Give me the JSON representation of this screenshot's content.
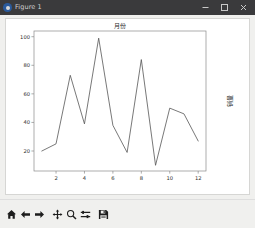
{
  "window": {
    "title": "Figure 1",
    "app_icon": "matplotlib-icon",
    "controls": [
      {
        "name": "minimize-button",
        "glyph": "minimize-icon"
      },
      {
        "name": "maximize-button",
        "glyph": "maximize-icon"
      },
      {
        "name": "close-button",
        "glyph": "close-icon"
      }
    ],
    "titlebar_color": "#3a3a3c",
    "chrome_color": "#f0f0ee"
  },
  "toolbar": {
    "buttons": [
      {
        "name": "home-button",
        "icon": "home-icon",
        "tooltip": "Reset original view"
      },
      {
        "name": "back-button",
        "icon": "arrow-left-icon",
        "tooltip": "Back to previous view"
      },
      {
        "name": "forward-button",
        "icon": "arrow-right-icon",
        "tooltip": "Forward to next view"
      },
      {
        "name": "pan-button",
        "icon": "move-cross-icon",
        "tooltip": "Pan axes with left mouse, zoom with right"
      },
      {
        "name": "zoom-button",
        "icon": "magnifier-icon",
        "tooltip": "Zoom to rectangle"
      },
      {
        "name": "subplots-button",
        "icon": "sliders-icon",
        "tooltip": "Configure subplots"
      },
      {
        "name": "save-button",
        "icon": "floppy-disk-icon",
        "tooltip": "Save the figure"
      }
    ]
  },
  "chart_data": {
    "type": "line",
    "title": "月份",
    "xlabel": "",
    "ylabel": "销量",
    "ylabel_position": "right",
    "grid": false,
    "legend": null,
    "line_color": "#555555",
    "line_width": 0.8,
    "x": [
      1,
      2,
      3,
      4,
      5,
      6,
      7,
      8,
      9,
      10,
      11,
      12
    ],
    "values": [
      20,
      25,
      73,
      39,
      99,
      38,
      19,
      84,
      10,
      50,
      46,
      27
    ],
    "xticks": [
      2,
      4,
      6,
      8,
      10,
      12
    ],
    "xticklabels": [
      "2",
      "4",
      "6",
      "8",
      "10",
      "12"
    ],
    "yticks": [
      20,
      40,
      60,
      80,
      100
    ],
    "yticklabels": [
      "20",
      "40",
      "60",
      "80",
      "100"
    ],
    "xlim": [
      0.45,
      12.55
    ],
    "ylim": [
      6,
      104
    ]
  }
}
